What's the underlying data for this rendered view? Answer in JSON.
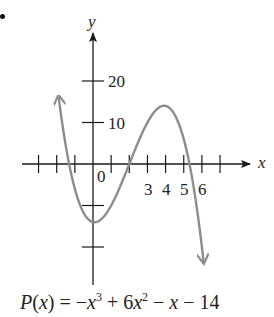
{
  "chart_data": {
    "type": "line",
    "title": "",
    "function": "P(x) = -x^3 + 6x^2 - x - 14",
    "coefficients": [
      -1,
      6,
      -1,
      -14
    ],
    "xlabel": "x",
    "ylabel": "y",
    "x_tick_positions": [
      -3,
      -2,
      -1,
      0,
      1,
      2,
      3,
      4,
      5,
      6,
      7
    ],
    "x_tick_labels": {
      "0": "0",
      "3": "3",
      "4": "4",
      "5": "5",
      "6": "6"
    },
    "y_tick_positions": [
      -20,
      -10,
      10,
      20
    ],
    "y_tick_labels": {
      "10": "10",
      "20": "20"
    },
    "xlim": [
      -3.0,
      8.7
    ],
    "ylim": [
      -29,
      31
    ],
    "domain_plotted": [
      -1.9,
      6.1
    ],
    "zeros_approx": [
      -1.41,
      2,
      5.41
    ],
    "local_min": {
      "x": 0.09,
      "y": -14.04
    },
    "local_max": {
      "x": 3.91,
      "y": 14.04
    },
    "grid": false,
    "legend": null,
    "curve_color": "#8c8c8c",
    "axis_color": "#1a1a1a",
    "end_behavior": "rises to left, falls to right (arrows)"
  },
  "labels": {
    "y_axis": "y",
    "x_axis": "x",
    "origin": "0",
    "x3": "3",
    "x4": "4",
    "x5": "5",
    "x6": "6",
    "y10": "10",
    "y20": "20"
  },
  "formula": {
    "lhs": "P(x) = ",
    "term1": "−x",
    "exp1": "3",
    "term2": " + 6x",
    "exp2": "2",
    "term3": " − x − 14"
  }
}
